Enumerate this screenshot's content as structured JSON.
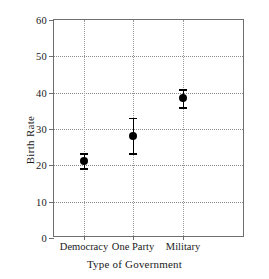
{
  "chart_data": {
    "type": "scatter",
    "title": "",
    "xlabel": "Type of Government",
    "ylabel": "Birth Rate",
    "categories": [
      "Democracy",
      "One Party",
      "Military"
    ],
    "values": [
      21.1,
      28.0,
      38.5
    ],
    "error_low": [
      19.0,
      23.2,
      35.8
    ],
    "error_high": [
      23.2,
      32.9,
      40.7
    ],
    "ylim": [
      0,
      60
    ],
    "ytick_labels": [
      "0",
      "10",
      "20",
      "30",
      "40",
      "50",
      "60"
    ],
    "ytick_values": [
      0,
      10,
      20,
      30,
      40,
      50,
      60
    ],
    "grid": true,
    "legend": "none",
    "marker_color": "#000000",
    "grid_color": "#8a8a8a",
    "axis_color": "#6e6e6e"
  }
}
